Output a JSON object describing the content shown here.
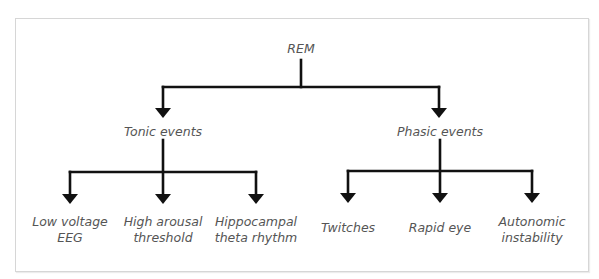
{
  "diagram": {
    "type": "tree",
    "colors": {
      "line": "#111111",
      "text": "#555555",
      "border": "#d6d6d6"
    },
    "root": {
      "label": "REM"
    },
    "branches": [
      {
        "label": "Tonic events",
        "children": [
          {
            "line1": "Low voltage",
            "line2": "EEG"
          },
          {
            "line1": "High arousal",
            "line2": "threshold"
          },
          {
            "line1": "Hippocampal",
            "line2": "theta rhythm"
          }
        ]
      },
      {
        "label": "Phasic events",
        "children": [
          {
            "line1": "Twitches",
            "line2": ""
          },
          {
            "line1": "Rapid eye",
            "line2": ""
          },
          {
            "line1": "Autonomic",
            "line2": "instability"
          }
        ]
      }
    ]
  }
}
